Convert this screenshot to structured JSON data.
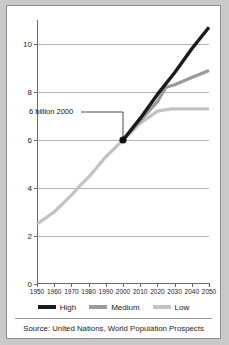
{
  "figure": {
    "background": "#ffffff",
    "border_color": "#8d8d8d",
    "page_background": "#c9c9c9"
  },
  "annotation": {
    "text": "6 billion 2000",
    "point_x": 2000,
    "point_y": 6.0
  },
  "legend": {
    "position": "bottom-center",
    "entries": [
      {
        "label": "High",
        "color": "#1a1a1a"
      },
      {
        "label": "Medium",
        "color": "#9a9a9a"
      },
      {
        "label": "Low",
        "color": "#c2c2c2"
      }
    ]
  },
  "source": {
    "text": "Source: United Nations, World Population Prospects"
  },
  "chart_data": {
    "type": "line",
    "title": "",
    "subtitle": "",
    "xlabel": "",
    "ylabel": "",
    "xlim": [
      1950,
      2050
    ],
    "ylim": [
      0,
      11
    ],
    "grid": true,
    "y_ticks": [
      0,
      2,
      4,
      6,
      8,
      10
    ],
    "x_ticks": [
      1950,
      1960,
      1970,
      1980,
      1990,
      2000,
      2010,
      2020,
      2030,
      2040,
      2050
    ],
    "historical": {
      "name": "Historical",
      "color": "#c2c2c2",
      "x": [
        1950,
        1960,
        1970,
        1975,
        1980,
        1990,
        2000
      ],
      "values": [
        2.5,
        3.0,
        3.7,
        4.1,
        4.45,
        5.3,
        6.0
      ]
    },
    "series": [
      {
        "name": "High",
        "color": "#1a1a1a",
        "x": [
          2000,
          2010,
          2020,
          2030,
          2040,
          2050
        ],
        "values": [
          6.0,
          6.9,
          7.9,
          8.8,
          9.8,
          10.7
        ]
      },
      {
        "name": "Medium",
        "color": "#9a9a9a",
        "x": [
          2000,
          2010,
          2020,
          2025,
          2030,
          2040,
          2050
        ],
        "values": [
          6.0,
          6.8,
          7.6,
          8.2,
          8.3,
          8.6,
          8.9
        ]
      },
      {
        "name": "Low",
        "color": "#c2c2c2",
        "x": [
          2000,
          2010,
          2020,
          2028,
          2030,
          2040,
          2050
        ],
        "values": [
          6.0,
          6.7,
          7.2,
          7.3,
          7.3,
          7.3,
          7.3
        ]
      }
    ]
  }
}
